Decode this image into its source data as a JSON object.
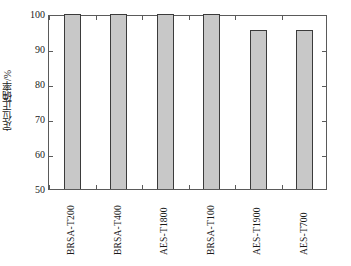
{
  "chart_data": {
    "type": "bar",
    "title": "",
    "subtitle": "",
    "xlabel": "",
    "ylabel": "定位正确率/%",
    "categories": [
      "BRSA-T200",
      "BRSA-T400",
      "AES-T1800",
      "BRSA-T100",
      "AES-T1900",
      "AES-T700"
    ],
    "values": [
      100,
      100,
      100,
      100,
      95.4,
      95.4
    ],
    "ylim": [
      50,
      100
    ],
    "yticks": [
      50,
      60,
      70,
      80,
      90,
      100
    ],
    "ytick_labels": [
      "50",
      "60",
      "70",
      "80",
      "90",
      "100"
    ],
    "grid": false,
    "legend": null,
    "legend_position": "none",
    "series": [
      {
        "name": "定位正确率",
        "values": [
          100,
          100,
          100,
          100,
          95.4,
          95.4
        ]
      }
    ],
    "colors": {
      "bar_fill": "#c8c8c8",
      "bar_edge": "#3b3b3b",
      "axis": "#5a5a5a",
      "text": "#1a1a1a",
      "background": "#ffffff"
    }
  },
  "caption": {
    "text": ""
  }
}
